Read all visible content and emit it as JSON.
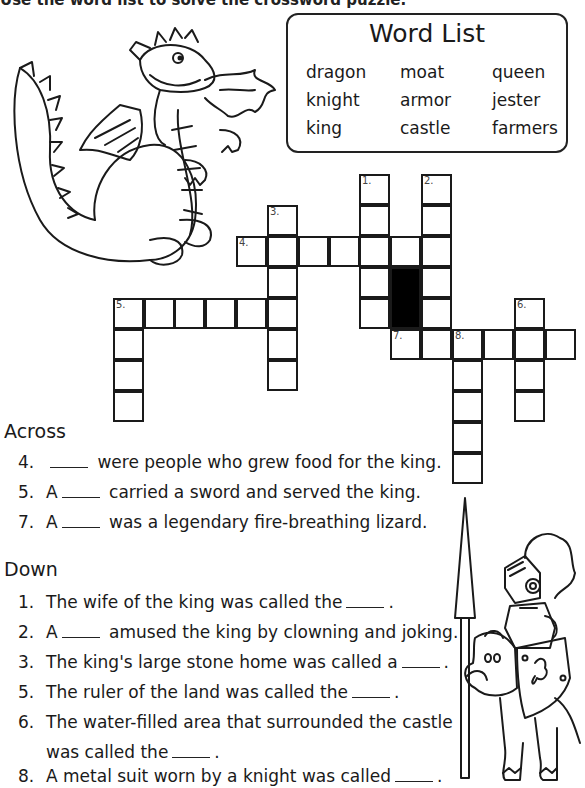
{
  "instructions": "Use the word list to solve the crossword puzzle.",
  "word_list": {
    "title": "Word List",
    "words": [
      "dragon",
      "moat",
      "queen",
      "knight",
      "armor",
      "jester",
      "king",
      "castle",
      "farmers"
    ]
  },
  "crossword": {
    "cell_size": 31,
    "numbers": [
      {
        "label": "1.",
        "x": 359,
        "y": 174
      },
      {
        "label": "2.",
        "x": 421,
        "y": 174
      },
      {
        "label": "3.",
        "x": 267,
        "y": 205
      },
      {
        "label": "4.",
        "x": 236,
        "y": 236
      },
      {
        "label": "5.",
        "x": 113,
        "y": 298
      },
      {
        "label": "6.",
        "x": 514,
        "y": 298
      },
      {
        "label": "7.",
        "x": 390,
        "y": 329
      },
      {
        "label": "8.",
        "x": 452,
        "y": 329
      }
    ],
    "black_cells": [
      {
        "x": 390,
        "y": 267,
        "h": 62
      }
    ]
  },
  "across": {
    "heading": "Across",
    "clues": [
      {
        "num": "4.",
        "pre": "",
        "post": "were people who grew food for the king."
      },
      {
        "num": "5.",
        "pre": "A",
        "post": "carried a sword and served the king."
      },
      {
        "num": "7.",
        "pre": "A",
        "post": "was a legendary fire-breathing lizard."
      }
    ]
  },
  "down": {
    "heading": "Down",
    "clues": [
      {
        "num": "1.",
        "pre": "The wife of the king was called the",
        "post": "."
      },
      {
        "num": "2.",
        "pre": "A",
        "post": "amused the king by clowning and joking."
      },
      {
        "num": "3.",
        "pre": "The king's large stone home was called a",
        "post": "."
      },
      {
        "num": "5.",
        "pre": "The ruler of the land was called the",
        "post": "."
      },
      {
        "num": "6.",
        "pre": "The water-filled area that surrounded the castle",
        "post": ""
      },
      {
        "num": "",
        "pre": "was called the",
        "post": "."
      },
      {
        "num": "8.",
        "pre": "A metal suit worn by a knight was called",
        "post": "."
      }
    ]
  },
  "illustrations": {
    "top_left": "dragon-breathing-fire",
    "bottom_right": "knight-on-horse"
  }
}
